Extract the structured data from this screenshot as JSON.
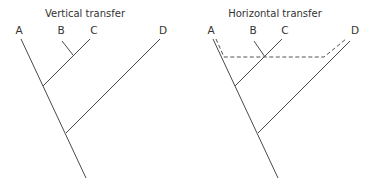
{
  "panels": [
    {
      "title": "Vertical transfer",
      "taxa": [
        "A",
        "B",
        "C",
        "D"
      ],
      "has_horizontal_transfer": false
    },
    {
      "title": "Horizontal transfer",
      "taxa": [
        "A",
        "B",
        "C",
        "D"
      ],
      "has_horizontal_transfer": true,
      "transfer_between": [
        "A",
        "D"
      ]
    }
  ],
  "colors": {
    "branch": "#4a4a4a",
    "transfer_dash": "#555555"
  }
}
